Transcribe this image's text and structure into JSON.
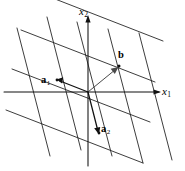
{
  "figure": {
    "kind": "lattice-diagram",
    "width": 185,
    "height": 171,
    "background_color": "#ffffff",
    "line_color": "#1a1a1a",
    "axis_color": "#111111",
    "vector_color": "#111111",
    "auxiliary_vector_color": "#4a4a4a",
    "origin": {
      "x": 88,
      "y": 92
    }
  },
  "axes": {
    "x_axis": {
      "name": "x1",
      "label_main": "x",
      "label_sub": "1",
      "orientation": "horizontal",
      "arrow": "right",
      "start": {
        "x": 5,
        "y": 92
      },
      "end": {
        "x": 160,
        "y": 92
      }
    },
    "y_axis": {
      "name": "x2",
      "label_main": "x",
      "label_sub": "2",
      "orientation": "vertical",
      "arrow": "up",
      "start": {
        "x": 88,
        "y": 165
      },
      "end": {
        "x": 88,
        "y": 16
      }
    }
  },
  "vectors": [
    {
      "name": "a1",
      "label_main": "a",
      "label_sub": "1",
      "style": "bold-italic-serif",
      "from": {
        "x": 88,
        "y": 92
      },
      "to": {
        "x": 57,
        "y": 80
      },
      "screen_delta": {
        "dx": -31,
        "dy": -12
      },
      "emphasis": "primary"
    },
    {
      "name": "a2",
      "label_main": "a",
      "label_sub": "2",
      "style": "bold-italic-serif",
      "from": {
        "x": 88,
        "y": 92
      },
      "to": {
        "x": 99,
        "y": 133
      },
      "screen_delta": {
        "dx": 11,
        "dy": 41
      },
      "emphasis": "primary"
    },
    {
      "name": "b",
      "label_main": "b",
      "label_sub": "",
      "style": "bold-serif",
      "from": {
        "x": 88,
        "y": 92
      },
      "to": {
        "x": 118,
        "y": 67
      },
      "screen_delta": {
        "dx": 30,
        "dy": -25
      },
      "emphasis": "secondary"
    }
  ],
  "lattice": {
    "description": "two families of parallel lines generated by the basis vectors",
    "family_a1": {
      "direction_name": "a1-direction",
      "direction": {
        "dx": -31,
        "dy": -12
      },
      "line_count": 5,
      "spacing_along_a2": 41
    },
    "family_a2": {
      "direction_name": "a2-direction",
      "direction": {
        "dx": 11,
        "dy": 41
      },
      "line_count": 5,
      "spacing_along_a1": 31
    },
    "marked_points": [
      {
        "name": "lattice-point-b",
        "x": 118,
        "y": 67
      },
      {
        "name": "lattice-point-a1",
        "x": 57,
        "y": 80
      },
      {
        "name": "lattice-point-a2",
        "x": 99,
        "y": 133
      }
    ]
  }
}
